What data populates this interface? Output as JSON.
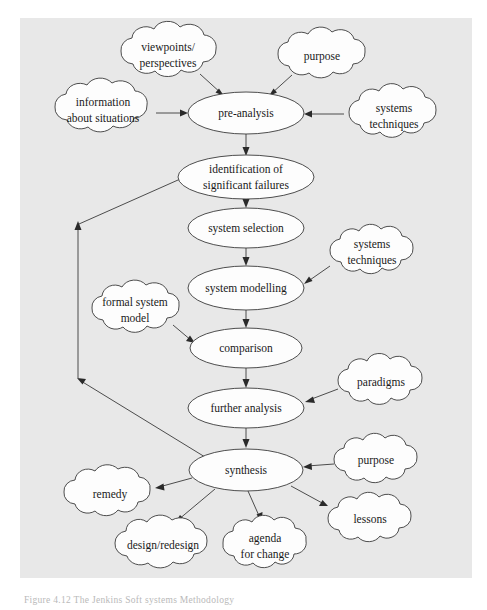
{
  "figure": {
    "caption": "Figure 4.12   The Jenkins Soft systems Methodology",
    "background_color": "#e8e8e8",
    "panel_color": "#e8e8e8",
    "line_color": "#3a3a3a",
    "shape_fill": "#fdfdfd"
  },
  "diagram": {
    "type": "flowchart",
    "processes": [
      {
        "id": "pre-analysis",
        "label": "pre-analysis",
        "cx": 246,
        "cy": 113,
        "rx": 58,
        "ry": 21,
        "lines": [
          "pre-analysis"
        ]
      },
      {
        "id": "identification",
        "label": "identification of significant failures",
        "cx": 246,
        "cy": 177,
        "rx": 68,
        "ry": 22,
        "lines": [
          "identification of",
          "significant failures"
        ]
      },
      {
        "id": "system-selection",
        "label": "system selection",
        "cx": 246,
        "cy": 228,
        "rx": 58,
        "ry": 20,
        "lines": [
          "system selection"
        ]
      },
      {
        "id": "system-modelling",
        "label": "system modelling",
        "cx": 246,
        "cy": 288,
        "rx": 58,
        "ry": 22,
        "lines": [
          "system modelling"
        ]
      },
      {
        "id": "comparison",
        "label": "comparison",
        "cx": 246,
        "cy": 348,
        "rx": 56,
        "ry": 20,
        "lines": [
          "comparison"
        ]
      },
      {
        "id": "further-analysis",
        "label": "further analysis",
        "cx": 246,
        "cy": 408,
        "rx": 58,
        "ry": 20,
        "lines": [
          "further analysis"
        ]
      },
      {
        "id": "synthesis",
        "label": "synthesis",
        "cx": 246,
        "cy": 470,
        "rx": 57,
        "ry": 21,
        "lines": [
          "synthesis"
        ]
      }
    ],
    "clouds": [
      {
        "id": "viewpoints",
        "label": "viewpoints/ perspectives",
        "cx": 168,
        "cy": 55,
        "rx": 52,
        "ry": 26,
        "lines": [
          "viewpoints/",
          "perspectives"
        ]
      },
      {
        "id": "purpose-top",
        "label": "purpose",
        "cx": 322,
        "cy": 57,
        "rx": 48,
        "ry": 24,
        "lines": [
          "purpose"
        ]
      },
      {
        "id": "information",
        "label": "information about situations",
        "cx": 103,
        "cy": 110,
        "rx": 52,
        "ry": 25,
        "lines": [
          "information",
          "about situations"
        ]
      },
      {
        "id": "systems-techniques-top",
        "label": "systems techniques",
        "cx": 394,
        "cy": 116,
        "rx": 48,
        "ry": 25,
        "lines": [
          "systems",
          "techniques"
        ]
      },
      {
        "id": "systems-techniques-mid",
        "label": "systems techniques",
        "cx": 372,
        "cy": 252,
        "rx": 45,
        "ry": 23,
        "lines": [
          "systems",
          "techniques"
        ]
      },
      {
        "id": "formal-system-model",
        "label": "formal system model",
        "cx": 135,
        "cy": 310,
        "rx": 48,
        "ry": 24,
        "lines": [
          "formal system",
          "model"
        ]
      },
      {
        "id": "paradigms",
        "label": "paradigms",
        "cx": 380,
        "cy": 382,
        "rx": 46,
        "ry": 23,
        "lines": [
          "paradigms"
        ]
      },
      {
        "id": "purpose-bottom",
        "label": "purpose",
        "cx": 375,
        "cy": 461,
        "rx": 45,
        "ry": 23,
        "lines": [
          "purpose"
        ]
      },
      {
        "id": "remedy",
        "label": "remedy",
        "cx": 110,
        "cy": 494,
        "rx": 46,
        "ry": 24,
        "lines": [
          "remedy"
        ]
      },
      {
        "id": "lessons",
        "label": "lessons",
        "cx": 369,
        "cy": 520,
        "rx": 45,
        "ry": 23,
        "lines": [
          "lessons"
        ]
      },
      {
        "id": "design-redesign",
        "label": "design/redesign",
        "cx": 163,
        "cy": 545,
        "rx": 52,
        "ry": 24,
        "lines": [
          "design/redesign"
        ]
      },
      {
        "id": "agenda-for-change",
        "label": "agenda for change",
        "cx": 265,
        "cy": 545,
        "rx": 45,
        "ry": 25,
        "lines": [
          "agenda",
          "for change"
        ]
      }
    ],
    "edges": [
      {
        "from": "viewpoints",
        "to": "pre-analysis"
      },
      {
        "from": "purpose-top",
        "to": "pre-analysis"
      },
      {
        "from": "information",
        "to": "pre-analysis"
      },
      {
        "from": "systems-techniques-top",
        "to": "pre-analysis"
      },
      {
        "from": "pre-analysis",
        "to": "identification"
      },
      {
        "from": "identification",
        "to": "system-selection"
      },
      {
        "from": "system-selection",
        "to": "system-modelling"
      },
      {
        "from": "systems-techniques-mid",
        "to": "system-modelling"
      },
      {
        "from": "system-modelling",
        "to": "comparison"
      },
      {
        "from": "formal-system-model",
        "to": "comparison"
      },
      {
        "from": "comparison",
        "to": "further-analysis"
      },
      {
        "from": "paradigms",
        "to": "further-analysis"
      },
      {
        "from": "further-analysis",
        "to": "synthesis"
      },
      {
        "from": "purpose-bottom",
        "to": "synthesis"
      },
      {
        "from": "synthesis",
        "to": "remedy"
      },
      {
        "from": "synthesis",
        "to": "design-redesign"
      },
      {
        "from": "synthesis",
        "to": "agenda-for-change"
      },
      {
        "from": "synthesis",
        "to": "lessons"
      },
      {
        "from": "synthesis",
        "to": "feedback-loop"
      },
      {
        "from": "feedback-loop",
        "to": "identification"
      }
    ]
  }
}
